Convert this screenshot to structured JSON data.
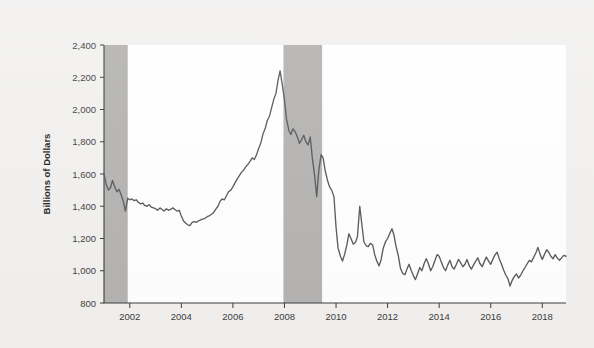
{
  "chart_data": {
    "type": "line",
    "title": "",
    "subtitle": "",
    "xlabel": "",
    "ylabel": "Billions of Dollars",
    "ylim": [
      800,
      2400
    ],
    "xlim": [
      2001.0,
      2018.92
    ],
    "y_ticks": [
      800,
      1000,
      1200,
      1400,
      1600,
      1800,
      2000,
      2200,
      2400
    ],
    "y_tick_labels": [
      "800",
      "1,000",
      "1,200",
      "1,400",
      "1,600",
      "1,800",
      "2,000",
      "2,200",
      "2,400"
    ],
    "x_ticks": [
      2002,
      2004,
      2006,
      2008,
      2010,
      2012,
      2014,
      2016,
      2018
    ],
    "x_tick_labels": [
      "2002",
      "2004",
      "2006",
      "2008",
      "2010",
      "2012",
      "2014",
      "2016",
      "2018"
    ],
    "grid": false,
    "legend": "none",
    "line_color": "#58585a",
    "plot_background": "#ffffff",
    "page_background": "#f2f1f0",
    "shaded_regions": [
      {
        "name": "recession-2001",
        "x_start": 2001.0,
        "x_end": 2001.92,
        "color": "#b4b3b2"
      },
      {
        "name": "recession-2007-2009",
        "x_start": 2007.96,
        "x_end": 2009.46,
        "color": "#b4b3b2"
      }
    ],
    "series": [
      {
        "name": "value",
        "x": [
          2001.0,
          2001.08,
          2001.17,
          2001.25,
          2001.33,
          2001.42,
          2001.5,
          2001.58,
          2001.67,
          2001.75,
          2001.83,
          2001.92,
          2002.0,
          2002.08,
          2002.17,
          2002.25,
          2002.33,
          2002.42,
          2002.5,
          2002.58,
          2002.67,
          2002.75,
          2002.83,
          2002.92,
          2003.0,
          2003.08,
          2003.17,
          2003.25,
          2003.33,
          2003.42,
          2003.5,
          2003.58,
          2003.67,
          2003.75,
          2003.83,
          2003.92,
          2004.0,
          2004.08,
          2004.17,
          2004.25,
          2004.33,
          2004.42,
          2004.5,
          2004.58,
          2004.67,
          2004.75,
          2004.83,
          2004.92,
          2005.0,
          2005.08,
          2005.17,
          2005.25,
          2005.33,
          2005.42,
          2005.5,
          2005.58,
          2005.67,
          2005.75,
          2005.83,
          2005.92,
          2006.0,
          2006.08,
          2006.17,
          2006.25,
          2006.33,
          2006.42,
          2006.5,
          2006.58,
          2006.67,
          2006.75,
          2006.83,
          2006.92,
          2007.0,
          2007.08,
          2007.17,
          2007.25,
          2007.33,
          2007.42,
          2007.5,
          2007.58,
          2007.67,
          2007.75,
          2007.83,
          2007.92,
          2008.0,
          2008.08,
          2008.17,
          2008.25,
          2008.33,
          2008.42,
          2008.5,
          2008.58,
          2008.67,
          2008.75,
          2008.83,
          2008.92,
          2009.0,
          2009.08,
          2009.17,
          2009.25,
          2009.33,
          2009.42,
          2009.5,
          2009.58,
          2009.67,
          2009.75,
          2009.83,
          2009.92,
          2010.0,
          2010.08,
          2010.17,
          2010.25,
          2010.33,
          2010.42,
          2010.5,
          2010.58,
          2010.67,
          2010.75,
          2010.83,
          2010.92,
          2011.0,
          2011.08,
          2011.17,
          2011.25,
          2011.33,
          2011.42,
          2011.5,
          2011.58,
          2011.67,
          2011.75,
          2011.83,
          2011.92,
          2012.0,
          2012.08,
          2012.17,
          2012.25,
          2012.33,
          2012.42,
          2012.5,
          2012.58,
          2012.67,
          2012.75,
          2012.83,
          2012.92,
          2013.0,
          2013.08,
          2013.17,
          2013.25,
          2013.33,
          2013.42,
          2013.5,
          2013.58,
          2013.67,
          2013.75,
          2013.83,
          2013.92,
          2014.0,
          2014.08,
          2014.17,
          2014.25,
          2014.33,
          2014.42,
          2014.5,
          2014.58,
          2014.67,
          2014.75,
          2014.83,
          2014.92,
          2015.0,
          2015.08,
          2015.17,
          2015.25,
          2015.33,
          2015.42,
          2015.5,
          2015.58,
          2015.67,
          2015.75,
          2015.83,
          2015.92,
          2016.0,
          2016.08,
          2016.17,
          2016.25,
          2016.33,
          2016.42,
          2016.5,
          2016.58,
          2016.67,
          2016.75,
          2016.83,
          2016.92,
          2017.0,
          2017.08,
          2017.17,
          2017.25,
          2017.33,
          2017.42,
          2017.5,
          2017.58,
          2017.67,
          2017.75,
          2017.83,
          2017.92,
          2018.0,
          2018.08,
          2018.17,
          2018.25,
          2018.33,
          2018.42,
          2018.5,
          2018.58,
          2018.67,
          2018.75,
          2018.83,
          2018.92
        ],
        "values": [
          1600,
          1540,
          1500,
          1515,
          1560,
          1520,
          1490,
          1505,
          1470,
          1430,
          1370,
          1450,
          1440,
          1445,
          1435,
          1440,
          1425,
          1415,
          1420,
          1405,
          1400,
          1410,
          1395,
          1390,
          1385,
          1375,
          1390,
          1380,
          1370,
          1385,
          1375,
          1380,
          1390,
          1380,
          1370,
          1375,
          1340,
          1310,
          1295,
          1285,
          1280,
          1300,
          1305,
          1300,
          1310,
          1315,
          1320,
          1325,
          1335,
          1340,
          1350,
          1360,
          1380,
          1400,
          1430,
          1445,
          1440,
          1465,
          1490,
          1500,
          1520,
          1545,
          1570,
          1590,
          1610,
          1625,
          1645,
          1660,
          1680,
          1700,
          1690,
          1720,
          1760,
          1790,
          1850,
          1880,
          1930,
          1960,
          2010,
          2060,
          2100,
          2180,
          2240,
          2150,
          2060,
          1940,
          1870,
          1845,
          1880,
          1860,
          1830,
          1790,
          1815,
          1840,
          1800,
          1780,
          1830,
          1700,
          1590,
          1460,
          1620,
          1720,
          1700,
          1620,
          1560,
          1520,
          1500,
          1460,
          1270,
          1140,
          1090,
          1060,
          1100,
          1160,
          1230,
          1200,
          1165,
          1175,
          1210,
          1400,
          1290,
          1180,
          1155,
          1150,
          1170,
          1160,
          1100,
          1060,
          1030,
          1070,
          1140,
          1180,
          1200,
          1230,
          1260,
          1220,
          1150,
          1090,
          1015,
          985,
          975,
          1010,
          1040,
          1000,
          970,
          945,
          985,
          1020,
          1000,
          1045,
          1075,
          1045,
          1000,
          1025,
          1060,
          1100,
          1090,
          1055,
          1020,
          1000,
          1035,
          1065,
          1025,
          1010,
          1040,
          1070,
          1050,
          1025,
          1040,
          1070,
          1030,
          1010,
          1035,
          1060,
          1080,
          1045,
          1025,
          1055,
          1085,
          1060,
          1040,
          1070,
          1100,
          1115,
          1075,
          1040,
          1005,
          975,
          950,
          905,
          940,
          965,
          980,
          955,
          975,
          1000,
          1020,
          1045,
          1065,
          1055,
          1085,
          1110,
          1145,
          1100,
          1070,
          1100,
          1130,
          1115,
          1090,
          1075,
          1100,
          1080,
          1065,
          1080,
          1095,
          1090
        ]
      }
    ]
  }
}
